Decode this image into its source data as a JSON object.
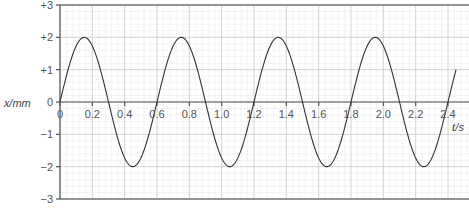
{
  "chart_data": {
    "type": "line",
    "title": "",
    "xlabel": "t",
    "xunit": "/s",
    "ylabel": "x",
    "yunit": "/mm",
    "xlim": [
      0,
      2.4
    ],
    "ylim": [
      -3,
      3
    ],
    "x_ticks": [
      0,
      0.2,
      0.4,
      0.6,
      0.8,
      1.0,
      1.2,
      1.4,
      1.6,
      1.8,
      2.0,
      2.2,
      2.4
    ],
    "x_tick_labels": [
      "0",
      "0.2",
      "0.4",
      "0.6",
      "0.8",
      "1.0",
      "1.2",
      "1.4",
      "1.6",
      "1.8",
      "2.0",
      "2.2",
      "2.4"
    ],
    "y_ticks": [
      3,
      2,
      1,
      0,
      -1,
      -2,
      -3
    ],
    "y_tick_labels": [
      "+3",
      "+2",
      "+1",
      "0",
      "−1",
      "−2",
      "−3"
    ],
    "grid": true,
    "grid_minor_per_major": 5,
    "series": [
      {
        "name": "displacement",
        "function": "x = 2 sin(2π t / 0.6)",
        "amplitude": 2,
        "period": 0.6,
        "t_start": 0,
        "t_end": 2.45,
        "key_points": [
          {
            "t": 0,
            "x": 0
          },
          {
            "t": 0.15,
            "x": 2
          },
          {
            "t": 0.3,
            "x": 0
          },
          {
            "t": 0.45,
            "x": -2
          },
          {
            "t": 0.6,
            "x": 0
          },
          {
            "t": 0.75,
            "x": 2
          },
          {
            "t": 0.9,
            "x": 0
          },
          {
            "t": 1.05,
            "x": -2
          },
          {
            "t": 1.2,
            "x": 0
          },
          {
            "t": 1.35,
            "x": 2
          },
          {
            "t": 1.5,
            "x": 0
          },
          {
            "t": 1.65,
            "x": -2
          },
          {
            "t": 1.8,
            "x": 0
          },
          {
            "t": 1.95,
            "x": 2
          },
          {
            "t": 2.1,
            "x": 0
          },
          {
            "t": 2.25,
            "x": -2
          },
          {
            "t": 2.4,
            "x": 0
          },
          {
            "t": 2.45,
            "x": 1.0
          }
        ]
      }
    ],
    "colors": {
      "curve": "#333333",
      "axis": "#555555",
      "grid_major": "#cfcfcf",
      "grid_minor": "#ececec",
      "frame": "#777777"
    }
  }
}
